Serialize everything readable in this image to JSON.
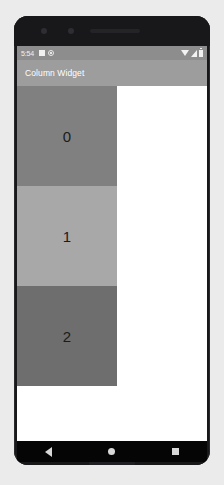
{
  "device": {
    "type": "android-phone-mockup",
    "bezel_color": "#18181a"
  },
  "status_bar": {
    "time": "5:54",
    "background_color": "#8d8d8d",
    "left_icons": [
      {
        "name": "notification-square-icon"
      },
      {
        "name": "notification-circle-icon"
      }
    ],
    "right_icons": [
      {
        "name": "wifi-icon"
      },
      {
        "name": "cellular-signal-icon"
      },
      {
        "name": "battery-icon"
      }
    ]
  },
  "app_bar": {
    "title": "Column Widget",
    "background_color": "#9d9d9d",
    "title_color": "#ffffff"
  },
  "column_widget": {
    "background_color": "#ffffff",
    "boxes": [
      {
        "label": "0",
        "color": "#808080"
      },
      {
        "label": "1",
        "color": "#a8a8a8"
      },
      {
        "label": "2",
        "color": "#6e6e6e"
      }
    ]
  },
  "nav_bar": {
    "background_color": "#050506",
    "buttons": [
      {
        "name": "back-button",
        "icon": "triangle-left-icon"
      },
      {
        "name": "home-button",
        "icon": "circle-icon"
      },
      {
        "name": "recents-button",
        "icon": "square-icon"
      }
    ]
  }
}
